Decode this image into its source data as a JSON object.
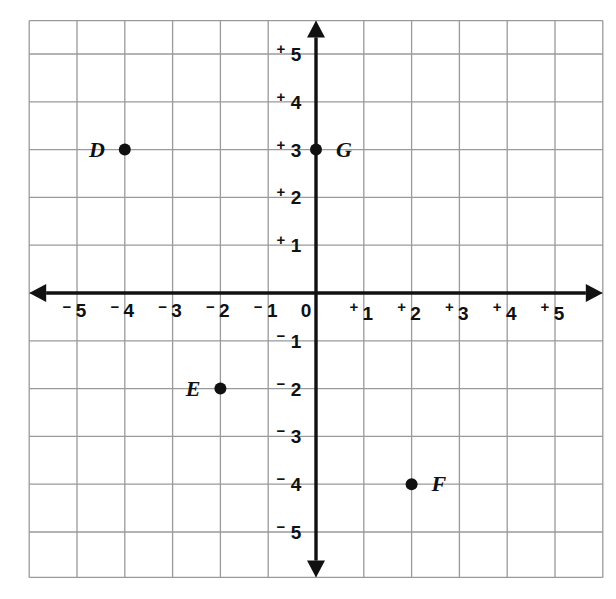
{
  "figure": {
    "title": "",
    "background_color": "#ffffff",
    "grid_color": "#9a9a9a",
    "axis_color": "#111111",
    "point_color": "#111111"
  },
  "chart_data": {
    "type": "scatter",
    "title": "",
    "xlabel": "",
    "ylabel": "",
    "xlim": [
      -6,
      6
    ],
    "ylim": [
      -6,
      6
    ],
    "grid": true,
    "legend": "none",
    "axis_arrows": true,
    "origin_label": "0",
    "x_ticks": [
      -5,
      -4,
      -3,
      -2,
      -1,
      1,
      2,
      3,
      4,
      5
    ],
    "y_ticks": [
      5,
      4,
      3,
      2,
      1,
      -1,
      -2,
      -3,
      -4,
      -5
    ],
    "x_tick_labels": [
      {
        "value": -5,
        "sign": "−",
        "digit": "5"
      },
      {
        "value": -4,
        "sign": "−",
        "digit": "4"
      },
      {
        "value": -3,
        "sign": "−",
        "digit": "3"
      },
      {
        "value": -2,
        "sign": "−",
        "digit": "2"
      },
      {
        "value": -1,
        "sign": "−",
        "digit": "1"
      },
      {
        "value": 1,
        "sign": "+",
        "digit": "1"
      },
      {
        "value": 2,
        "sign": "+",
        "digit": "2"
      },
      {
        "value": 3,
        "sign": "+",
        "digit": "3"
      },
      {
        "value": 4,
        "sign": "+",
        "digit": "4"
      },
      {
        "value": 5,
        "sign": "+",
        "digit": "5"
      }
    ],
    "y_tick_labels": [
      {
        "value": 5,
        "sign": "+",
        "digit": "5"
      },
      {
        "value": 4,
        "sign": "+",
        "digit": "4"
      },
      {
        "value": 3,
        "sign": "+",
        "digit": "3"
      },
      {
        "value": 2,
        "sign": "+",
        "digit": "2"
      },
      {
        "value": 1,
        "sign": "+",
        "digit": "1"
      },
      {
        "value": -1,
        "sign": "−",
        "digit": "1"
      },
      {
        "value": -2,
        "sign": "−",
        "digit": "2"
      },
      {
        "value": -3,
        "sign": "−",
        "digit": "3"
      },
      {
        "value": -4,
        "sign": "−",
        "digit": "4"
      },
      {
        "value": -5,
        "sign": "−",
        "digit": "5"
      }
    ],
    "points": [
      {
        "label": "D",
        "x": -4,
        "y": 3,
        "label_side": "left"
      },
      {
        "label": "E",
        "x": -2,
        "y": -2,
        "label_side": "left"
      },
      {
        "label": "F",
        "x": 2,
        "y": -4,
        "label_side": "right"
      },
      {
        "label": "G",
        "x": 0,
        "y": 3,
        "label_side": "right"
      }
    ]
  }
}
